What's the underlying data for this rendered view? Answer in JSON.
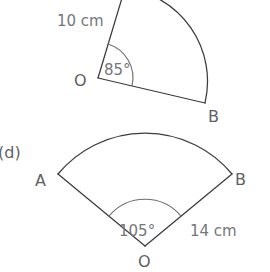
{
  "page": {
    "background_color": "#ffffff",
    "line_color": "#3b3b3f",
    "text_color": "#5f5f63",
    "measure_text_color": "#76767a",
    "width": 270,
    "height": 272
  },
  "figures": [
    {
      "id": "sector-top",
      "description": "circular sector partially cropped at top of image",
      "vertex_label": "O",
      "arc_end_label": "B",
      "angle_label": "85°",
      "angle_value": 85,
      "angle_unit": "degrees",
      "radius_label": "10 cm",
      "radius_value": 10,
      "radius_unit": "cm",
      "cropped": true
    },
    {
      "id": "sector-bottom",
      "part_label": "(d)",
      "description": "circular sector with vertex at bottom",
      "vertex_label": "O",
      "arc_start_label": "A",
      "arc_end_label": "B",
      "angle_label": "105°",
      "angle_value": 105,
      "angle_unit": "degrees",
      "radius_label": "14 cm",
      "radius_value": 14,
      "radius_unit": "cm",
      "cropped": false
    }
  ]
}
